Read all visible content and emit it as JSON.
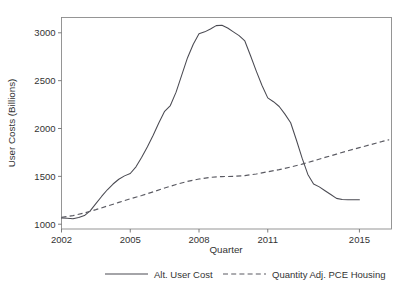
{
  "chart_data": {
    "type": "line",
    "title": "",
    "xlabel": "Quarter",
    "ylabel": "User Costs (Billions)",
    "xlim": [
      2002.0,
      2016.4
    ],
    "ylim": [
      950,
      3160
    ],
    "grid": false,
    "legend_position": "bottom-outside",
    "xticks": [
      2002,
      2005,
      2008,
      2011,
      2015
    ],
    "xtick_labels": [
      "2002",
      "2005",
      "2008",
      "2011",
      "2015"
    ],
    "yticks": [
      1000,
      1500,
      2000,
      2500,
      3000
    ],
    "ytick_labels": [
      "1000",
      "1500",
      "2000",
      "2500",
      "3000"
    ],
    "series": [
      {
        "name": "Alt. User Cost",
        "style": "solid",
        "color": "#4a4a52",
        "x": [
          2002.0,
          2002.25,
          2002.5,
          2002.75,
          2003.0,
          2003.25,
          2003.5,
          2003.75,
          2004.0,
          2004.25,
          2004.5,
          2004.75,
          2005.0,
          2005.25,
          2005.5,
          2005.75,
          2006.0,
          2006.25,
          2006.5,
          2006.75,
          2007.0,
          2007.25,
          2007.5,
          2007.75,
          2008.0,
          2008.25,
          2008.5,
          2008.75,
          2009.0,
          2009.25,
          2009.5,
          2009.75,
          2010.0,
          2010.25,
          2010.5,
          2010.75,
          2011.0,
          2011.25,
          2011.5,
          2011.75,
          2012.0,
          2012.25,
          2012.5,
          2012.75,
          2013.0,
          2013.25,
          2013.5,
          2013.75,
          2014.0,
          2014.25,
          2014.5,
          2014.75,
          2015.0
        ],
        "y": [
          1065,
          1062,
          1058,
          1070,
          1090,
          1140,
          1215,
          1290,
          1360,
          1420,
          1470,
          1505,
          1530,
          1600,
          1700,
          1810,
          1930,
          2060,
          2180,
          2240,
          2380,
          2560,
          2740,
          2880,
          2990,
          3010,
          3040,
          3075,
          3080,
          3050,
          3010,
          2970,
          2915,
          2760,
          2600,
          2450,
          2320,
          2280,
          2230,
          2150,
          2060,
          1880,
          1690,
          1520,
          1420,
          1390,
          1350,
          1310,
          1270,
          1258,
          1255,
          1255,
          1255
        ]
      },
      {
        "name": "Quantity Adj. PCE Housing",
        "style": "dashed",
        "color": "#5a5a62",
        "x": [
          2002.0,
          2002.5,
          2003.0,
          2003.5,
          2004.0,
          2004.5,
          2005.0,
          2005.5,
          2006.0,
          2006.5,
          2007.0,
          2007.5,
          2008.0,
          2008.5,
          2009.0,
          2009.5,
          2010.0,
          2010.5,
          2011.0,
          2011.5,
          2012.0,
          2012.5,
          2013.0,
          2013.5,
          2014.0,
          2014.5,
          2015.0,
          2015.5,
          2016.0,
          2016.3
        ],
        "y": [
          1072,
          1090,
          1118,
          1152,
          1190,
          1228,
          1265,
          1300,
          1338,
          1378,
          1415,
          1448,
          1472,
          1490,
          1498,
          1500,
          1508,
          1525,
          1548,
          1570,
          1598,
          1628,
          1662,
          1698,
          1732,
          1768,
          1800,
          1832,
          1865,
          1882
        ]
      }
    ]
  },
  "legend": {
    "entries": [
      {
        "label": "Alt. User Cost",
        "style": "solid"
      },
      {
        "label": "Quantity Adj. PCE Housing",
        "style": "dashed"
      }
    ]
  }
}
